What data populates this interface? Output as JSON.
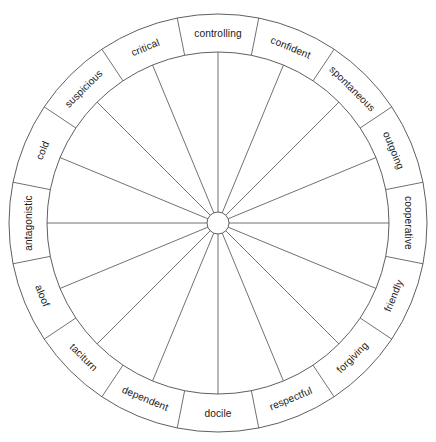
{
  "diagram": {
    "type": "circumplex-wheel",
    "sector_count": 16,
    "sector_span_degrees": 22.5,
    "geometry": {
      "center_x": 218,
      "center_y": 223,
      "outer_radius": 209,
      "label_ring_inner_radius": 171,
      "hub_radius": 11
    },
    "colors": {
      "background": "#ffffff",
      "line": "#4d4d4d",
      "text": "#1a1a1a"
    },
    "sectors": [
      {
        "label": "controlling",
        "angle_deg": 0
      },
      {
        "label": "confident",
        "angle_deg": 22.5
      },
      {
        "label": "spontaneous",
        "angle_deg": 45
      },
      {
        "label": "outgoing",
        "angle_deg": 67.5
      },
      {
        "label": "cooperative",
        "angle_deg": 90
      },
      {
        "label": "friendly",
        "angle_deg": 112.5
      },
      {
        "label": "forgiving",
        "angle_deg": 135
      },
      {
        "label": "respectful",
        "angle_deg": 157.5
      },
      {
        "label": "docile",
        "angle_deg": 180
      },
      {
        "label": "dependent",
        "angle_deg": 202.5
      },
      {
        "label": "taciturn",
        "angle_deg": 225
      },
      {
        "label": "aloof",
        "angle_deg": 247.5
      },
      {
        "label": "antagonistic",
        "angle_deg": 270
      },
      {
        "label": "cold",
        "angle_deg": 292.5
      },
      {
        "label": "suspicious",
        "angle_deg": 315
      },
      {
        "label": "critical",
        "angle_deg": 337.5
      }
    ]
  }
}
